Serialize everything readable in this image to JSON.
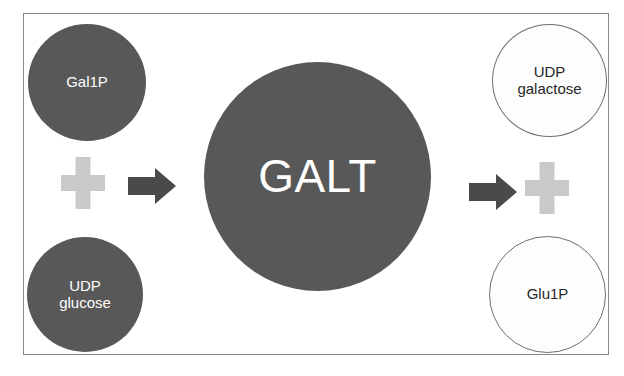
{
  "diagram": {
    "frame": {
      "border_color": "#8a8a8a",
      "background": "#ffffff"
    },
    "colors": {
      "substrate_fill": "#585858",
      "substrate_text": "#ffffff",
      "product_fill": "#fdfdfd",
      "product_outline": "#6e6e6e",
      "product_text": "#262626",
      "enzyme_fill": "#585858",
      "enzyme_text": "#ffffff",
      "plus_sign": "#c9c9c9",
      "arrow": "#4a4a4a"
    },
    "nodes": {
      "substrate_top": {
        "label": "Gal1P",
        "role": "substrate"
      },
      "substrate_bottom": {
        "label": "UDP\nglucose",
        "role": "substrate"
      },
      "enzyme": {
        "label": "GALT",
        "role": "enzyme"
      },
      "product_top": {
        "label": "UDP\ngalactose",
        "role": "product"
      },
      "product_bottom": {
        "label": "Glu1P",
        "role": "product"
      }
    },
    "operators": {
      "plus_left": "plus-sign",
      "plus_right": "plus-sign",
      "arrow_left": "arrow-right-icon",
      "arrow_right": "arrow-right-icon"
    }
  }
}
